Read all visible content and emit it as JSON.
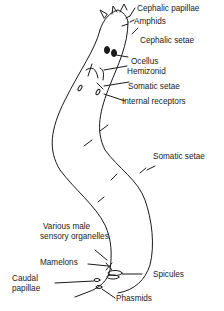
{
  "diagram": {
    "labels": {
      "cephalic_papillae": "Cephalic papillae",
      "amphids": "Amphids",
      "cephalic_setae": "Cephalic setae",
      "ocellus": "Ocellus",
      "hemizonid": "Hemizonid",
      "somatic_setae_head": "Somatic setae",
      "internal_receptors": "Internal receptors",
      "somatic_setae_body": "Somatic setae",
      "various_male_line1": "Various male",
      "various_male_line2": "sensory organelles",
      "mamelons": "Mamelons",
      "caudal_line1": "Caudal",
      "caudal_line2": "papillae",
      "spicules": "Spicules",
      "phasmids": "Phasmids"
    },
    "colors": {
      "line": "#1a1a1a",
      "background": "#ffffff"
    }
  }
}
